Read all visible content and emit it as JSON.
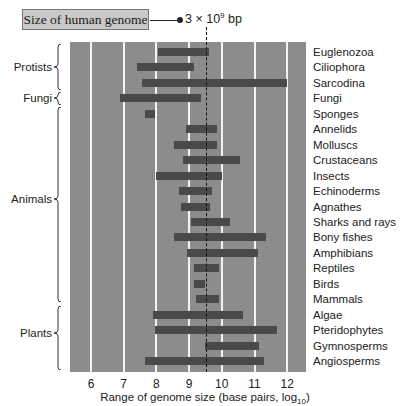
{
  "annotation": {
    "box_label": "Size of human genome",
    "value_text_prefix": "3 × 10",
    "value_text_exp": "9",
    "value_text_suffix": " bp",
    "value_log10": 9.48
  },
  "colors": {
    "plot_bg": "#8c8c8c",
    "bar": "#4a4a4a",
    "grid": "#f2f2f2",
    "box_bg": "#c9c9c9"
  },
  "chart_data": {
    "type": "bar",
    "orientation": "horizontal-range",
    "title": "Size of human genome",
    "xlabel": "Range of genome size (base pairs, log10)",
    "ylabel": "",
    "xlim": [
      5.4,
      12.6
    ],
    "xticks": [
      6,
      7,
      8,
      9,
      10,
      11,
      12
    ],
    "grid": true,
    "reference_line": {
      "label": "3 × 10^9 bp",
      "x": 9.48,
      "style": "dashed"
    },
    "groups": [
      {
        "name": "Protists",
        "members": [
          "Euglenozoa",
          "Ciliophora",
          "Sarcodina"
        ]
      },
      {
        "name": "Fungi",
        "members": [
          "Fungi"
        ]
      },
      {
        "name": "Animals",
        "members": [
          "Sponges",
          "Annelids",
          "Molluscs",
          "Crustaceans",
          "Insects",
          "Echinoderms",
          "Agnathes",
          "Sharks and rays",
          "Bony fishes",
          "Amphibians",
          "Reptiles",
          "Birds",
          "Mammals"
        ]
      },
      {
        "name": "Plants",
        "members": [
          "Algae",
          "Pteridophytes",
          "Gymnosperms",
          "Angiosperms"
        ]
      }
    ],
    "categories": [
      "Euglenozoa",
      "Ciliophora",
      "Sarcodina",
      "Fungi",
      "Sponges",
      "Annelids",
      "Molluscs",
      "Crustaceans",
      "Insects",
      "Echinoderms",
      "Agnathes",
      "Sharks and rays",
      "Bony fishes",
      "Amphibians",
      "Reptiles",
      "Birds",
      "Mammals",
      "Algae",
      "Pteridophytes",
      "Gymnosperms",
      "Angiosperms"
    ],
    "ranges": [
      [
        8.05,
        9.6
      ],
      [
        7.4,
        9.15
      ],
      [
        7.55,
        12.0
      ],
      [
        6.9,
        9.35
      ],
      [
        7.65,
        7.95
      ],
      [
        8.9,
        9.85
      ],
      [
        8.55,
        9.85
      ],
      [
        8.8,
        10.55
      ],
      [
        8.0,
        10.0
      ],
      [
        8.7,
        9.7
      ],
      [
        8.75,
        9.65
      ],
      [
        9.05,
        10.25
      ],
      [
        8.55,
        11.35
      ],
      [
        8.95,
        11.1
      ],
      [
        9.15,
        9.9
      ],
      [
        9.15,
        9.5
      ],
      [
        9.2,
        9.9
      ],
      [
        7.9,
        10.65
      ],
      [
        7.95,
        11.7
      ],
      [
        9.5,
        11.15
      ],
      [
        7.65,
        11.3
      ]
    ]
  },
  "axis": {
    "ticks": [
      "6",
      "7",
      "8",
      "9",
      "10",
      "11",
      "12"
    ],
    "label_main": "Range of genome size (base pairs, log",
    "label_sub": "10",
    "label_end": ")"
  },
  "groups": [
    {
      "label": "Protists"
    },
    {
      "label": "Fungi"
    },
    {
      "label": "Animals"
    },
    {
      "label": "Plants"
    }
  ]
}
